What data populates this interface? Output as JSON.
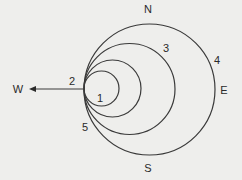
{
  "diagram": {
    "type": "nested tangent circles with compass directions",
    "directions": {
      "north": "N",
      "south": "S",
      "east": "E",
      "west": "W"
    },
    "circle_labels": [
      "1",
      "2",
      "3",
      "4",
      "5"
    ],
    "arrow": {
      "direction": "west",
      "points_to": "W"
    },
    "colors": {
      "background": "#eeeeec",
      "stroke": "#3a3a3a",
      "text": "#2a2a2a"
    }
  }
}
